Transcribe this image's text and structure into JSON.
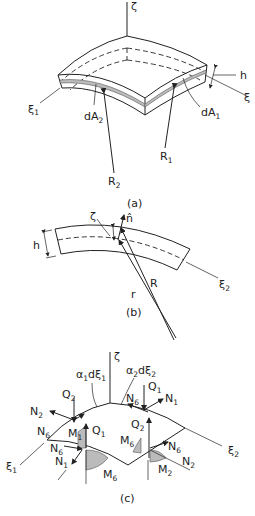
{
  "figure": {
    "panels": [
      {
        "id": "a",
        "caption": "(a)",
        "labels": {
          "zeta": "ζ",
          "xi1": "ξ",
          "xi1_sub": "1",
          "xi2": "ξ",
          "xi2_sub": "2",
          "h": "h",
          "dA2": "dA",
          "dA2_sub": "2",
          "dA1": "dA",
          "dA1_sub": "1",
          "R1": "R",
          "R1_sub": "1",
          "R2": "R",
          "R2_sub": "2"
        }
      },
      {
        "id": "b",
        "caption": "(b)",
        "labels": {
          "zeta": "ζ",
          "n_hat": "n̂",
          "h": "h",
          "R": "R",
          "r": "r",
          "xi2": "ξ",
          "xi2_sub": "2"
        }
      },
      {
        "id": "c",
        "caption": "(c)",
        "labels": {
          "zeta": "ζ",
          "alpha1dxi1": "α",
          "alpha1dxi1_sub": "1",
          "alpha1dxi1_tail": "dξ",
          "alpha1dxi1_tail_sub": "1",
          "alpha2dxi2": "α",
          "alpha2dxi2_sub": "2",
          "alpha2dxi2_tail": "dξ",
          "alpha2dxi2_tail_sub": "2",
          "Q1_top": "Q",
          "Q1_top_sub": "1",
          "N1_top": "N",
          "N1_top_sub": "1",
          "N6_top": "N",
          "N6_top_sub": "6",
          "Q2_left": "Q",
          "Q2_left_sub": "2",
          "N2_left": "N",
          "N2_left_sub": "2",
          "N6_left": "N",
          "N6_left_sub": "6",
          "M1": "M",
          "M1_sub": "1",
          "Q1_front": "Q",
          "Q1_front_sub": "1",
          "N6_front": "N",
          "N6_front_sub": "6",
          "N1_front": "N",
          "N1_front_sub": "1",
          "M6_front": "M",
          "M6_front_sub": "6",
          "Q2_right": "Q",
          "Q2_right_sub": "2",
          "M6_right": "M",
          "M6_right_sub": "6",
          "N6_right": "N",
          "N6_right_sub": "6",
          "N2_right": "N",
          "N2_right_sub": "2",
          "M2": "M",
          "M2_sub": "2",
          "xi1": "ξ",
          "xi1_sub": "1",
          "xi2": "ξ",
          "xi2_sub": "2"
        }
      }
    ]
  }
}
